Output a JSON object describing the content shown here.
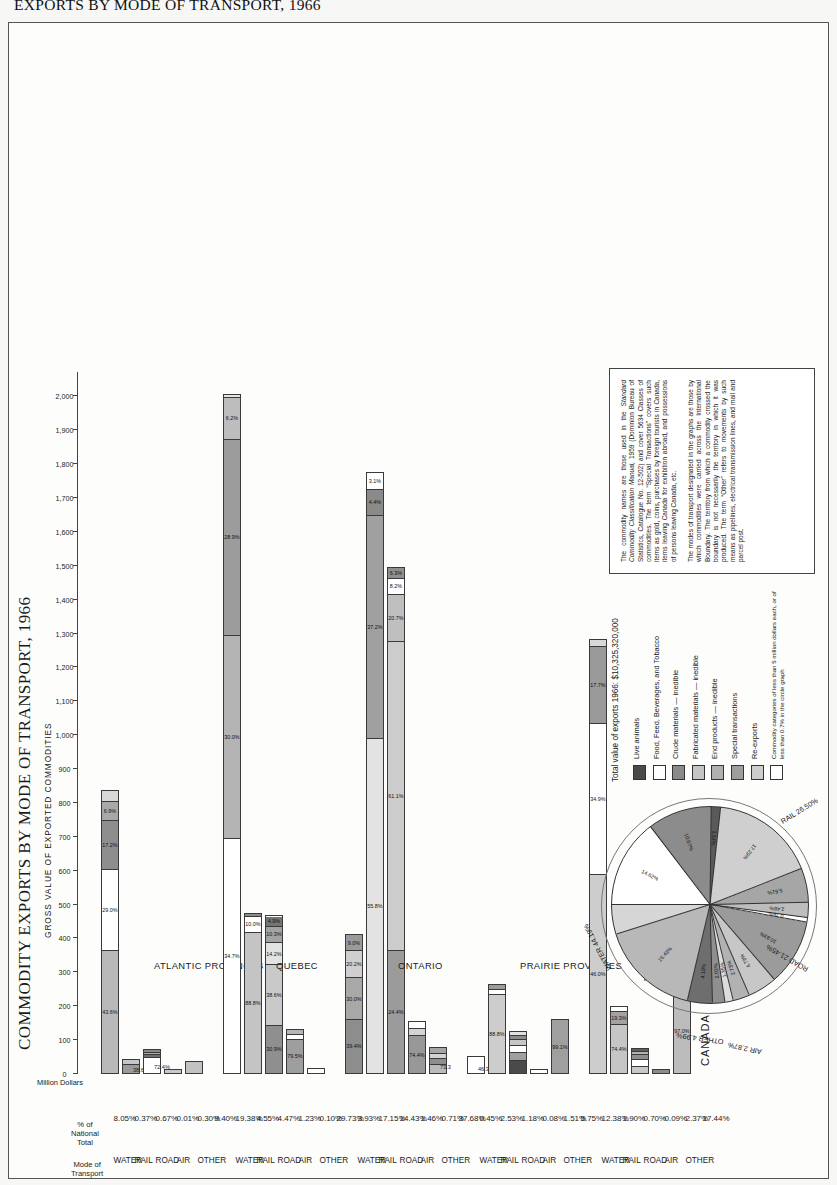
{
  "outer_title": "EXPORTS BY MODE OF TRANSPORT, 1966",
  "title": "COMMODITY EXPORTS BY MODE OF TRANSPORT, 1966",
  "subtitle": "GROSS VALUE OF EXPORTED COMMODITIES",
  "axis": {
    "unit_label": "Million Dollars",
    "ticks": [
      "0",
      "100",
      "200",
      "300",
      "400",
      "500",
      "600",
      "700",
      "800",
      "900",
      "1,000",
      "1,100",
      "1,200",
      "1,300",
      "1,400",
      "1,500",
      "1,600",
      "1,700",
      "1,800",
      "1,900",
      "2,000"
    ],
    "max": 2060
  },
  "columns": {
    "mode_header": "Mode of\nTransport",
    "pct_header": "% of\nNational\nTotal"
  },
  "chart_data": {
    "type": "bar",
    "title": "COMMODITY EXPORTS BY MODE OF TRANSPORT, 1966",
    "subtitle": "GROSS VALUE OF EXPORTED COMMODITIES",
    "xlabel": "Million Dollars",
    "ylabel": "Mode of Transport",
    "xlim": [
      0,
      2060
    ],
    "grid": false,
    "orientation": "horizontal-stacked",
    "regions": [
      {
        "name": "ATLANTIC PROVINCES",
        "total_pct": "9.40%",
        "rows": [
          {
            "mode": "WATER",
            "pct": "8.05%",
            "value": 831,
            "endlabel": "",
            "segments": [
              {
                "pct": "43.6%",
                "value": 362,
                "color": "#b9b9b9"
              },
              {
                "pct": "29.0%",
                "value": 241,
                "color": "#ffffff"
              },
              {
                "pct": "17.2%",
                "value": 143,
                "color": "#8e8e8e"
              },
              {
                "pct": "6.9%",
                "value": 57,
                "color": "#a8a8a8"
              },
              {
                "pct": "",
                "value": 28,
                "color": "#d8d8d8"
              }
            ]
          },
          {
            "mode": "RAIL",
            "pct": "0.37%",
            "value": 38,
            "endlabel": "38.6",
            "segments": [
              {
                "pct": "",
                "value": 26,
                "color": "#9a9a9a"
              },
              {
                "pct": "",
                "value": 12,
                "color": "#c6c6c6"
              }
            ]
          },
          {
            "mode": "ROAD",
            "pct": "0.67%",
            "value": 69,
            "endlabel": "72.4%",
            "segments": [
              {
                "pct": "",
                "value": 48,
                "color": "#ffffff"
              },
              {
                "pct": "",
                "value": 9,
                "color": "#707070"
              },
              {
                "pct": "",
                "value": 6,
                "color": "#b0b0b0"
              },
              {
                "pct": "",
                "value": 6,
                "color": "#8a8a8a"
              }
            ]
          },
          {
            "mode": "AIR",
            "pct": "0.01%",
            "value": 4,
            "endlabel": "",
            "segments": [
              {
                "pct": "",
                "value": 4,
                "color": "#c9c9c9"
              }
            ]
          },
          {
            "mode": "OTHER",
            "pct": "0.30%",
            "value": 31,
            "endlabel": "",
            "segments": [
              {
                "pct": "",
                "value": 31,
                "color": "#c2c2c2"
              }
            ]
          }
        ]
      },
      {
        "name": "QUEBEC",
        "total_pct": "29.73%",
        "rows": [
          {
            "mode": "WATER",
            "pct": "19.38%",
            "value": 2001,
            "endlabel": "",
            "segments": [
              {
                "pct": "34.7%",
                "value": 694,
                "color": "#ffffff"
              },
              {
                "pct": "30.0%",
                "value": 600,
                "color": "#b4b4b4"
              },
              {
                "pct": "28.9%",
                "value": 578,
                "color": "#9c9c9c"
              },
              {
                "pct": "6.2%",
                "value": 124,
                "color": "#bdbdbd"
              },
              {
                "pct": "",
                "value": 5,
                "color": "#e6e6e6"
              }
            ]
          },
          {
            "mode": "RAIL",
            "pct": "4.55%",
            "value": 470,
            "endlabel": "",
            "segments": [
              {
                "pct": "88.8%",
                "value": 417,
                "color": "#c4c4c4"
              },
              {
                "pct": "10.0%",
                "value": 47,
                "color": "#ffffff"
              },
              {
                "pct": "",
                "value": 6,
                "color": "#8c8c8c"
              }
            ]
          },
          {
            "mode": "ROAD",
            "pct": "4.47%",
            "value": 462,
            "endlabel": "",
            "segments": [
              {
                "pct": "30.9%",
                "value": 143,
                "color": "#8f8f8f"
              },
              {
                "pct": "38.6%",
                "value": 178,
                "color": "#c9c9c9"
              },
              {
                "pct": "14.2%",
                "value": 66,
                "color": "#e2e2e2"
              },
              {
                "pct": "10.3%",
                "value": 48,
                "color": "#a3a3a3"
              },
              {
                "pct": "4.9%",
                "value": 27,
                "color": "#757575"
              }
            ]
          },
          {
            "mode": "AIR",
            "pct": "1.23%",
            "value": 127,
            "endlabel": "",
            "segments": [
              {
                "pct": "79.5%",
                "value": 101,
                "color": "#9e9e9e"
              },
              {
                "pct": "",
                "value": 14,
                "color": "#ffffff"
              },
              {
                "pct": "",
                "value": 12,
                "color": "#b6b6b6"
              }
            ]
          },
          {
            "mode": "OTHER",
            "pct": "0.10%",
            "value": 11,
            "endlabel": "",
            "segments": [
              {
                "pct": "",
                "value": 11,
                "color": "#ffffff"
              }
            ]
          }
        ]
      },
      {
        "name": "ONTARIO",
        "total_pct": "37.68%",
        "rows": [
          {
            "mode": "WATER",
            "pct": "3.93%",
            "value": 406,
            "endlabel": "",
            "segments": [
              {
                "pct": "39.4%",
                "value": 160,
                "color": "#8d8d8d"
              },
              {
                "pct": "30.0%",
                "value": 122,
                "color": "#a8a8a8"
              },
              {
                "pct": "20.2%",
                "value": 82,
                "color": "#cfcfcf"
              },
              {
                "pct": "9.0%",
                "value": 42,
                "color": "#9a9a9a"
              }
            ]
          },
          {
            "mode": "RAIL",
            "pct": "17.15%",
            "value": 1771,
            "endlabel": "",
            "segments": [
              {
                "pct": "55.8%",
                "value": 988,
                "color": "#e3e3e3"
              },
              {
                "pct": "37.2%",
                "value": 659,
                "color": "#a0a0a0"
              },
              {
                "pct": "4.4%",
                "value": 78,
                "color": "#8a8a8a"
              },
              {
                "pct": "3.1%",
                "value": 46,
                "color": "#ffffff"
              }
            ]
          },
          {
            "mode": "ROAD",
            "pct": "14.43%",
            "value": 1490,
            "endlabel": "",
            "segments": [
              {
                "pct": "24.4%",
                "value": 364,
                "color": "#9b9b9b"
              },
              {
                "pct": "61.1%",
                "value": 910,
                "color": "#cccccc"
              },
              {
                "pct": "20.7%",
                "value": 140,
                "color": "#bfbfbf"
              },
              {
                "pct": "8.2%",
                "value": 48,
                "color": "#ffffff"
              },
              {
                "pct": "6.3%",
                "value": 28,
                "color": "#8f8f8f"
              }
            ]
          },
          {
            "mode": "AIR",
            "pct": "1.46%",
            "value": 151,
            "endlabel": "",
            "segments": [
              {
                "pct": "74.4%",
                "value": 112,
                "color": "#989898"
              },
              {
                "pct": "",
                "value": 20,
                "color": "#d4d4d4"
              },
              {
                "pct": "",
                "value": 19,
                "color": "#ffffff"
              }
            ]
          },
          {
            "mode": "OTHER",
            "pct": "0.71%",
            "value": 73,
            "endlabel": "73.3",
            "segments": [
              {
                "pct": "",
                "value": 26,
                "color": "#bbbbbb"
              },
              {
                "pct": "",
                "value": 18,
                "color": "#8e8e8e"
              },
              {
                "pct": "",
                "value": 16,
                "color": "#d2d2d2"
              },
              {
                "pct": "",
                "value": 13,
                "color": "#a5a5a5"
              }
            ]
          }
        ]
      },
      {
        "name": "PRAIRIE PROVINCES",
        "total_pct": "5.75%",
        "rows": [
          {
            "mode": "WATER",
            "pct": "0.45%",
            "value": 46,
            "endlabel": "46.3",
            "segments": [
              {
                "pct": "",
                "value": 46,
                "color": "#ffffff"
              }
            ]
          },
          {
            "mode": "RAIL",
            "pct": "2.53%",
            "value": 261,
            "endlabel": "",
            "segments": [
              {
                "pct": "88.8%",
                "value": 232,
                "color": "#cdcdcd"
              },
              {
                "pct": "",
                "value": 17,
                "color": "#ffffff"
              },
              {
                "pct": "",
                "value": 12,
                "color": "#9c9c9c"
              }
            ]
          },
          {
            "mode": "ROAD",
            "pct": "1.18%",
            "value": 122,
            "endlabel": "",
            "segments": [
              {
                "pct": "",
                "value": 38,
                "color": "#4a4a4a"
              },
              {
                "pct": "",
                "value": 24,
                "color": "#a0a0a0"
              },
              {
                "pct": "",
                "value": 20,
                "color": "#ffffff"
              },
              {
                "pct": "",
                "value": 18,
                "color": "#c6c6c6"
              },
              {
                "pct": "",
                "value": 12,
                "color": "#8b8b8b"
              },
              {
                "pct": "",
                "value": 10,
                "color": "#e0e0e0"
              }
            ]
          },
          {
            "mode": "AIR",
            "pct": "0.08%",
            "value": 9,
            "endlabel": "",
            "segments": [
              {
                "pct": "",
                "value": 9,
                "color": "#ffffff"
              }
            ]
          },
          {
            "mode": "OTHER",
            "pct": "1.51%",
            "value": 156,
            "endlabel": "",
            "segments": [
              {
                "pct": "99.1%",
                "value": 156,
                "color": "#9f9f9f"
              }
            ]
          }
        ]
      },
      {
        "name": "BRITISH COLUMBIA,\nYUKON AND NORTHWEST\nTERRITORIES",
        "total_pct": "17.44%",
        "rows": [
          {
            "mode": "WATER",
            "pct": "12.38%",
            "value": 1278,
            "endlabel": "",
            "segments": [
              {
                "pct": "46.0%",
                "value": 588,
                "color": "#cdcdcd"
              },
              {
                "pct": "34.9%",
                "value": 446,
                "color": "#ffffff"
              },
              {
                "pct": "17.7%",
                "value": 226,
                "color": "#9a9a9a"
              },
              {
                "pct": "",
                "value": 18,
                "color": "#d8d8d8"
              }
            ]
          },
          {
            "mode": "RAIL",
            "pct": "1.90%",
            "value": 196,
            "endlabel": "",
            "segments": [
              {
                "pct": "74.4%",
                "value": 146,
                "color": "#c6c6c6"
              },
              {
                "pct": "19.3%",
                "value": 38,
                "color": "#a2a2a2"
              },
              {
                "pct": "",
                "value": 12,
                "color": "#ffffff"
              }
            ]
          },
          {
            "mode": "ROAD",
            "pct": "0.70%",
            "value": 72,
            "endlabel": "",
            "segments": [
              {
                "pct": "",
                "value": 22,
                "color": "#c9c9c9"
              },
              {
                "pct": "",
                "value": 20,
                "color": "#ffffff"
              },
              {
                "pct": "",
                "value": 14,
                "color": "#8d8d8d"
              },
              {
                "pct": "",
                "value": 9,
                "color": "#b3b3b3"
              },
              {
                "pct": "",
                "value": 7,
                "color": "#5e5e5e"
              }
            ]
          },
          {
            "mode": "AIR",
            "pct": "0.09%",
            "value": 10,
            "endlabel": "",
            "segments": [
              {
                "pct": "",
                "value": 10,
                "color": "#8c8c8c"
              }
            ]
          },
          {
            "mode": "OTHER",
            "pct": "2.37%",
            "value": 245,
            "endlabel": "",
            "segments": [
              {
                "pct": "97.0%",
                "value": 245,
                "color": "#bcbcbc"
              }
            ]
          }
        ]
      }
    ]
  },
  "pie": {
    "center_label": "CANADA",
    "total_label": "Total value of exports 1966:   $10,325,320,000",
    "arcs": [
      {
        "name": "WATER",
        "pct": "44.19%"
      },
      {
        "name": "RAIL",
        "pct": "26.50%"
      },
      {
        "name": "ROAD",
        "pct": "21.45%"
      },
      {
        "name": "AIR",
        "pct": "2.87%"
      },
      {
        "name": "OTHER",
        "pct": "4.99%"
      }
    ],
    "slices": [
      {
        "pct": "14.62%",
        "value": 14.62,
        "color": "#ffffff"
      },
      {
        "pct": "10.57%",
        "value": 10.57,
        "color": "#8c8c8c"
      },
      {
        "pct": "1.54%",
        "value": 1.54,
        "color": "#5a5a5a"
      },
      {
        "pct": "17.29%",
        "value": 17.29,
        "color": "#cfcfcf"
      },
      {
        "pct": "5.61%",
        "value": 5.61,
        "color": "#a6a6a6"
      },
      {
        "pct": "2.48%",
        "value": 2.48,
        "color": "#bdbdbd"
      },
      {
        "pct": "0.76%",
        "value": 0.76,
        "color": "#ffffff"
      },
      {
        "pct": "10.83%",
        "value": 10.83,
        "color": "#9b9b9b"
      },
      {
        "pct": "4.79%",
        "value": 4.79,
        "color": "#c7c7c7"
      },
      {
        "pct": "2.73%",
        "value": 2.73,
        "color": "#b2b2b2"
      },
      {
        "pct": "1.35%",
        "value": 1.35,
        "color": "#dcdcdc"
      },
      {
        "pct": "2.03%",
        "value": 2.03,
        "color": "#8f8f8f"
      },
      {
        "pct": "4.10%",
        "value": 4.1,
        "color": "#6e6e6e"
      },
      {
        "pct": "16.43%",
        "value": 16.43,
        "color": "#b8b8b8"
      },
      {
        "pct": "",
        "value": 4.87,
        "color": "#d6d6d6"
      }
    ],
    "legend": [
      {
        "label": "Live animals",
        "color": "#4a4a4a"
      },
      {
        "label": "Food, Feed, Beverages, and Tobacco",
        "color": "#ffffff"
      },
      {
        "label": "Crude materials — inedible",
        "color": "#8a8a8a"
      },
      {
        "label": "Fabricated materials — inedible",
        "color": "#c4c4c4"
      },
      {
        "label": "End products — inedible",
        "color": "#b0b0b0"
      },
      {
        "label": "Special transactions",
        "color": "#9e9e9e"
      },
      {
        "label": "Re-exports",
        "color": "#cdcdcd"
      },
      {
        "label": "Commodity categories of less than 5 million dollars each, or of less than 0.7% in the circle graph",
        "color": "#ffffff",
        "small": true
      }
    ]
  },
  "notes": {
    "p1_a": "The commodity names are those used in the ",
    "p1_ital": "Standard Commodity Classification Manual,",
    "p1_b": " 1959 (Dominion Bureau of Statistics, Catalogue No. 12-502) and cover 5634 Classes of commodities. The term “Special Transactions” covers such items as gold, coins, purchases by foreign tourists in Canada, items leaving Canada for exhibition abroad, and possessions of persons leaving Canada, etc.",
    "p2": "The modes of transport designated in the graphs are those by which commodities were carried across the International Boundary. The territory from which a commodity crossed the boundary is not necessarily the territory in which it was produced. The term “Other” refers to movements by such means as pipelines, electrical transmission lines, and mail and parcel post."
  }
}
